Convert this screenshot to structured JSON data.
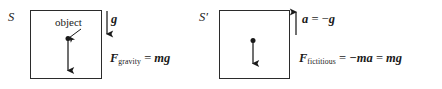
{
  "figure": {
    "type": "physics-diagram",
    "background_color": "#ffffff",
    "ink_color": "#1a1a1a"
  },
  "frames": [
    {
      "id": "S",
      "label": "S",
      "box": {
        "x": 30,
        "y": 10,
        "width": 72,
        "height": 69
      },
      "callout": {
        "text": "object",
        "x": 55,
        "y": 17,
        "pointer_from": {
          "x": 80,
          "y": 30
        },
        "pointer_to": {
          "x": 68,
          "y": 38
        }
      },
      "particle": {
        "x": 68,
        "y": 38
      },
      "body_arrow": {
        "name": "gravity-force-arrow",
        "from": {
          "x": 68,
          "y": 38
        },
        "to": {
          "x": 68,
          "y": 71
        },
        "direction": "down"
      },
      "field_arrow": {
        "name": "gravitational-field-arrow",
        "symbol": "g",
        "from": {
          "x": 107,
          "y": 11
        },
        "to": {
          "x": 107,
          "y": 35
        },
        "direction": "down"
      },
      "field_label": {
        "symbol": "g",
        "x": 111,
        "y": 13
      },
      "equation": {
        "name": "f-gravity-equation",
        "lhs_symbol": "F",
        "lhs_subscript": "gravity",
        "operator": "=",
        "rhs": "mg",
        "plain_text": "F_gravity = mg",
        "x": 110,
        "y": 52
      }
    },
    {
      "id": "S'",
      "label": "S",
      "label_prime": "′",
      "box": {
        "x": 219,
        "y": 10,
        "width": 71,
        "height": 69
      },
      "particle": {
        "x": 253,
        "y": 40
      },
      "body_arrow": {
        "name": "fictitious-force-arrow",
        "from": {
          "x": 253,
          "y": 40
        },
        "to": {
          "x": 253,
          "y": 64
        },
        "direction": "down"
      },
      "field_arrow": {
        "name": "acceleration-arrow",
        "symbol": "a",
        "from": {
          "x": 296,
          "y": 35
        },
        "to": {
          "x": 296,
          "y": 11
        },
        "direction": "up"
      },
      "field_label": {
        "symbol": "a",
        "operator": "=",
        "negation": "−",
        "rhs": "g",
        "plain_text": "a = −g",
        "x": 302,
        "y": 13
      },
      "equation": {
        "name": "f-fictitious-equation",
        "lhs_symbol": "F",
        "lhs_subscript": "fictitious",
        "operator_1": "=",
        "term_1": "−ma",
        "operator_2": "=",
        "term_2": "mg",
        "plain_text": "F_fictitious = −ma = mg",
        "x": 299,
        "y": 52
      }
    }
  ],
  "glyphs": {
    "equals": "=",
    "minus": "−",
    "prime": "′",
    "F": "F",
    "m": "m",
    "a": "a",
    "g": "g",
    "gravity_subscript": "gravity",
    "fictitious_subscript": "fictitious"
  }
}
